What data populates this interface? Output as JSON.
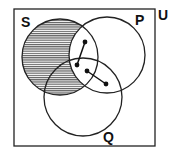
{
  "diagram": {
    "type": "venn",
    "universe_label": "U",
    "sets": [
      {
        "id": "S",
        "label": "S",
        "cx": 60,
        "cy": 57,
        "r": 38
      },
      {
        "id": "P",
        "label": "P",
        "cx": 107,
        "cy": 55,
        "r": 38
      },
      {
        "id": "Q",
        "label": "Q",
        "cx": 83,
        "cy": 97,
        "r": 39
      }
    ],
    "shaded_region": "S minus P",
    "shading": {
      "pattern": "horizontal-lines",
      "color": "#333333"
    },
    "points": [
      {
        "x": 85,
        "y": 42
      },
      {
        "x": 77,
        "y": 65
      },
      {
        "x": 87,
        "y": 71
      },
      {
        "x": 106,
        "y": 84
      }
    ],
    "segments": [
      {
        "from": 0,
        "to": 1
      },
      {
        "from": 2,
        "to": 3
      }
    ],
    "colors": {
      "stroke": "#222222",
      "background": "#ffffff"
    }
  }
}
